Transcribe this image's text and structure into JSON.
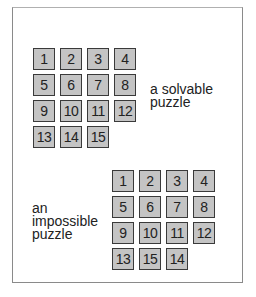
{
  "diagram": {
    "solvable": {
      "label_lines": [
        "a solvable",
        "puzzle"
      ],
      "tiles": [
        "1",
        "2",
        "3",
        "4",
        "5",
        "6",
        "7",
        "8",
        "9",
        "10",
        "11",
        "12",
        "13",
        "14",
        "15"
      ]
    },
    "impossible": {
      "label_lines": [
        "an",
        "impossible",
        "puzzle"
      ],
      "tiles": [
        "1",
        "2",
        "3",
        "4",
        "5",
        "6",
        "7",
        "8",
        "9",
        "10",
        "11",
        "12",
        "13",
        "15",
        "14"
      ]
    },
    "colors": {
      "tile_fill": "#c4c4c4",
      "tile_border": "#3a3a3a",
      "frame": "#8a8a8a"
    }
  }
}
